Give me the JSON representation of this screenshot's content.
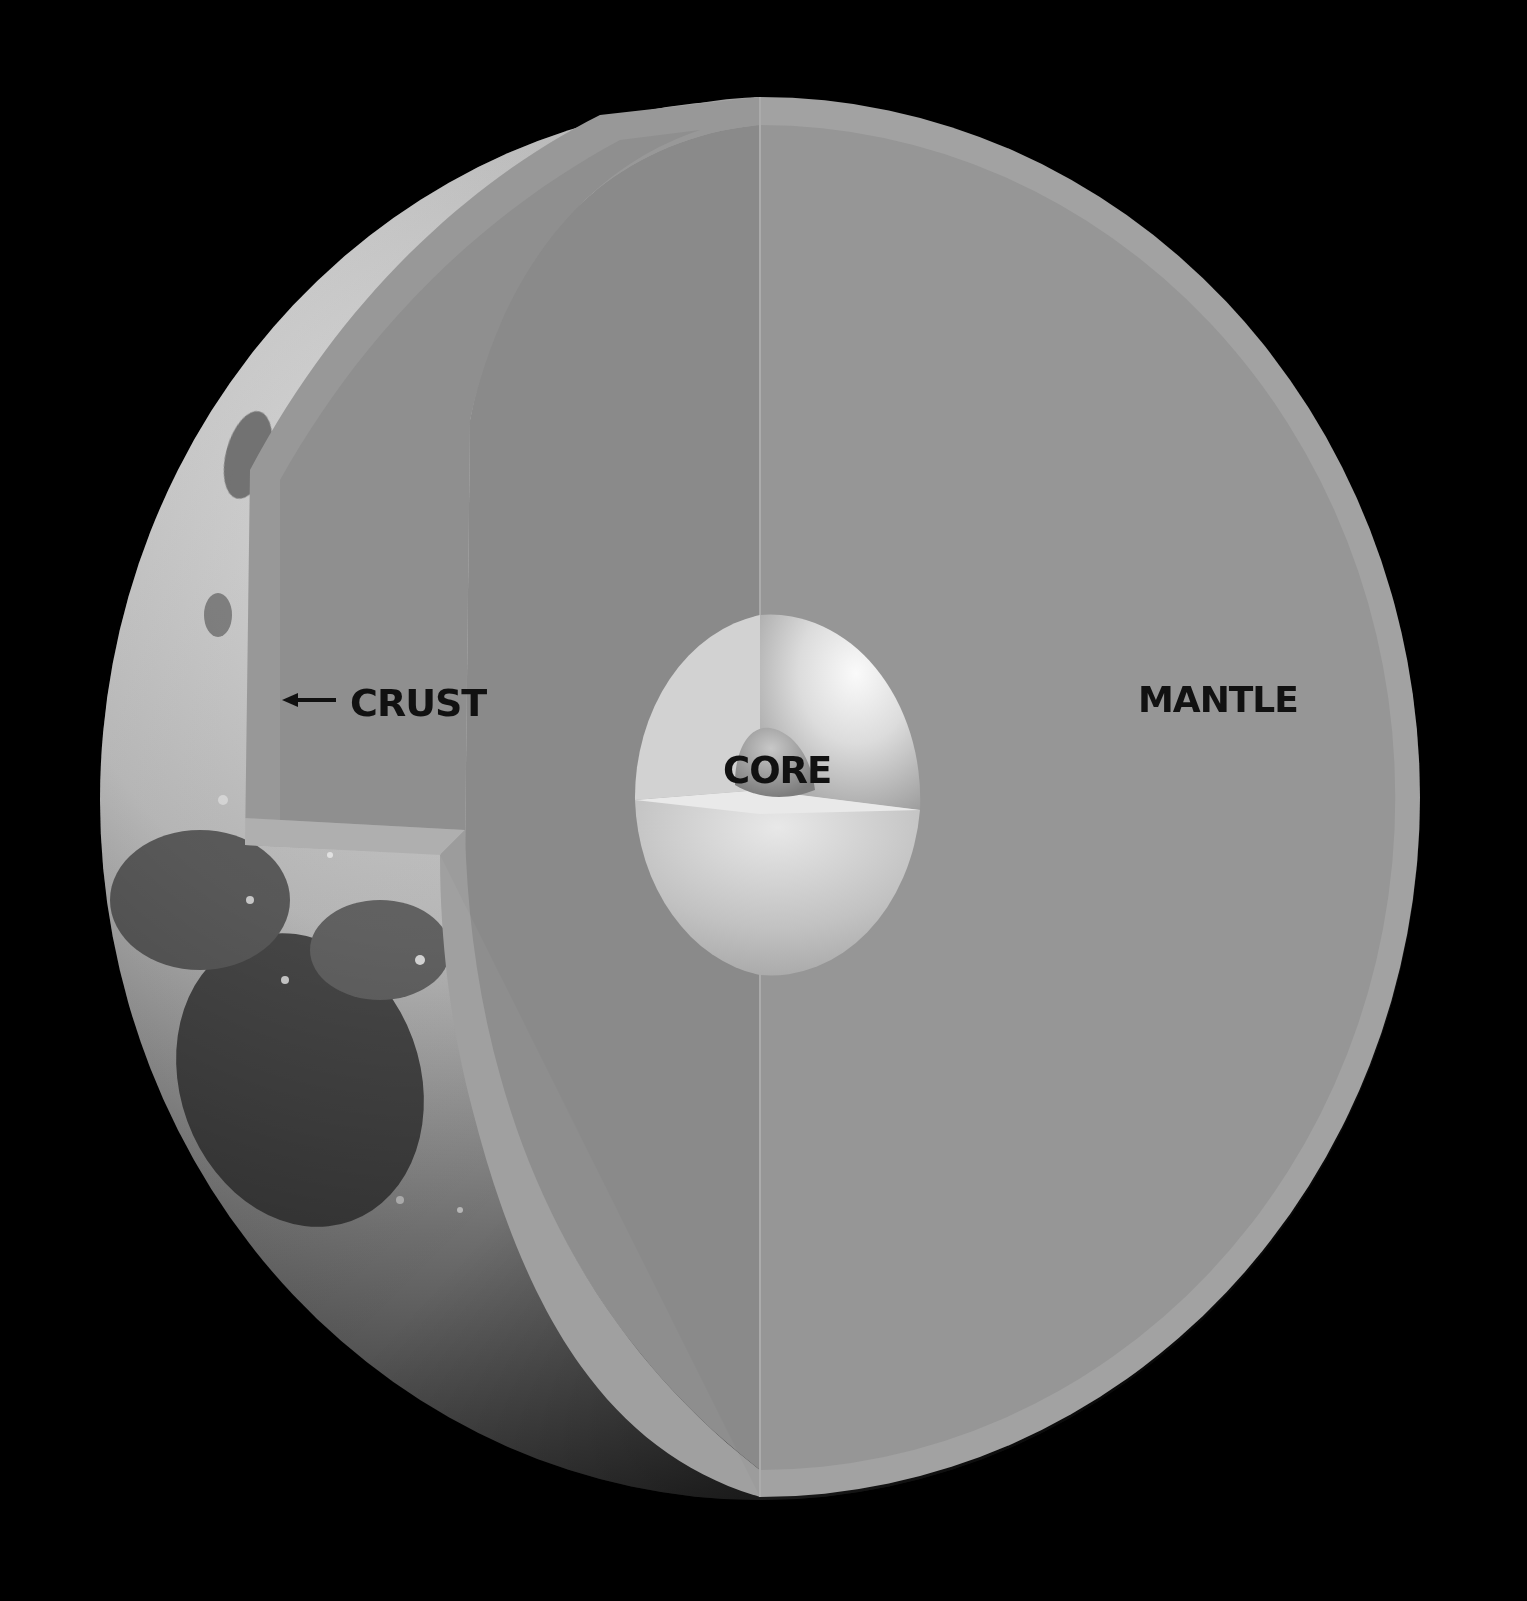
{
  "diagram": {
    "labels": {
      "crust": "CRUST",
      "mantle": "MANTLE",
      "core": "CORE"
    },
    "annotations": {
      "crust_arrow": "left-arrow"
    },
    "colors": {
      "background": "#000000",
      "surface_light": "#d8d8d8",
      "surface_dark": "#2a2a2a",
      "mantle_face": "#9a9a9a",
      "mantle_inner_face": "#8c8c8c",
      "crust_rim": "#a8a8a8",
      "core_light": "#f2f2f2",
      "core_shadow": "#b8b8b8",
      "label_text": "#111111"
    }
  }
}
